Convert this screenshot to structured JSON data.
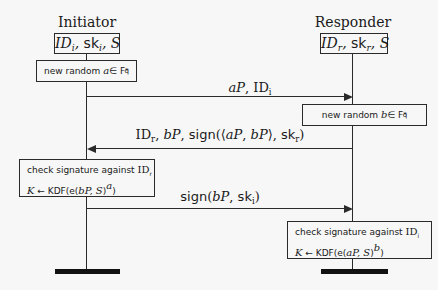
{
  "diagram": {
    "type": "sequence-diagram",
    "participants": [
      {
        "id": "initiator",
        "title": "Initiator",
        "keys": "IDᵢ, skᵢ, S",
        "keys_parts": {
          "id": "ID",
          "id_sub": "i",
          "sk": "sk",
          "sk_sub": "i",
          "s": "S"
        }
      },
      {
        "id": "responder",
        "title": "Responder",
        "keys": "IDᵣ, skᵣ, S",
        "keys_parts": {
          "id": "ID",
          "id_sub": "r",
          "sk": "sk",
          "sk_sub": "r",
          "s": "S"
        }
      }
    ],
    "steps": [
      {
        "kind": "action",
        "actor": "initiator",
        "text": "new random a ∈ F_q^*",
        "prefix": "new random ",
        "var": "a",
        "suffix": " ∈ F",
        "sub": "q",
        "sup": "*"
      },
      {
        "kind": "message",
        "from": "initiator",
        "to": "responder",
        "label": "aP, IDᵢ"
      },
      {
        "kind": "action",
        "actor": "responder",
        "text": "new random b ∈ F_q^*",
        "prefix": "new random ",
        "var": "b",
        "suffix": " ∈ F",
        "sub": "q",
        "sup": "*"
      },
      {
        "kind": "message",
        "from": "responder",
        "to": "initiator",
        "label": "IDᵣ, bP, sign(⟨aP, bP⟩, skᵣ)"
      },
      {
        "kind": "action",
        "actor": "initiator",
        "line1": "check signature against IDᵣ",
        "line2": "K ← KDF(e(bP, S)^a)",
        "line1_prefix": "check signature against ",
        "line1_id": "ID",
        "line1_sub": "r",
        "line2_k": "K",
        "line2_arrow": " ← ",
        "line2_kdf": "KDF(e(",
        "line2_arg": "bP, S",
        "line2_close": ")",
        "line2_sup": "a",
        "line2_end": ")"
      },
      {
        "kind": "message",
        "from": "initiator",
        "to": "responder",
        "label": "sign(bP, skᵢ)"
      },
      {
        "kind": "action",
        "actor": "responder",
        "line1": "check signature against IDᵢ",
        "line2": "K ← KDF(e(aP, S)^b)",
        "line1_prefix": "check signature against ",
        "line1_id": "ID",
        "line1_sub": "i",
        "line2_k": "K",
        "line2_arrow": " ← ",
        "line2_kdf": "KDF(e(",
        "line2_arg": "aP, S",
        "line2_close": ")",
        "line2_sup": "b",
        "line2_end": ")"
      }
    ],
    "messages": {
      "m1": {
        "a": "aP",
        "sep": ", ",
        "id": "ID",
        "sub": "i"
      },
      "m2": {
        "id": "ID",
        "sub": "r",
        "p1": ", ",
        "bp": "bP",
        "p2": ", ",
        "sign": "sign",
        "open": "(⟨",
        "ap": "aP",
        "comma": ", ",
        "bp2": "bP",
        "close": "⟩, ",
        "sk": "sk",
        "sksub": "r",
        "end": ")"
      },
      "m3": {
        "sign": "sign",
        "open": "(",
        "bp": "bP",
        "comma": ", ",
        "sk": "sk",
        "sksub": "i",
        "end": ")"
      }
    },
    "colors": {
      "ink": "#1a1a1a",
      "background": "#f7f7f7"
    }
  }
}
